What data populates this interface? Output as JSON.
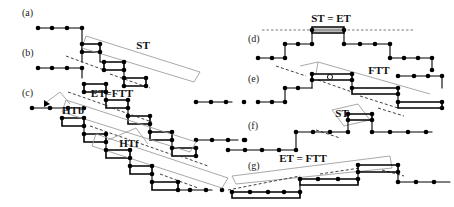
{
  "figure": {
    "width": 454,
    "height": 207,
    "background_color": "#ffffff",
    "node_color": "#000000",
    "edge_color": "#000000",
    "bracket_color": "#9a9a9a",
    "dashed_color": "#2a2a2a"
  },
  "panels": [
    {
      "id": "a",
      "label": "(a)",
      "x": 22,
      "y": 16,
      "operations": []
    },
    {
      "id": "b",
      "label": "(b)",
      "x": 22,
      "y": 56,
      "operations": [
        "ST"
      ]
    },
    {
      "id": "c",
      "label": "(c)",
      "x": 22,
      "y": 96,
      "operations": [
        "ET = FTT",
        "HTb",
        "HTf"
      ]
    },
    {
      "id": "d",
      "label": "(d)",
      "x": 248,
      "y": 42,
      "operations": [
        "ST = ET"
      ]
    },
    {
      "id": "e",
      "label": "(e)",
      "x": 248,
      "y": 82,
      "operations": [
        "FTT"
      ]
    },
    {
      "id": "f",
      "label": "(f)",
      "x": 248,
      "y": 129,
      "operations": [
        "ST"
      ]
    },
    {
      "id": "g",
      "label": "(g)",
      "x": 248,
      "y": 169,
      "operations": [
        "ET = FTT"
      ]
    }
  ],
  "operation_labels": [
    {
      "key": "st_b",
      "text": "ST",
      "x": 143,
      "y": 49,
      "panel": "b"
    },
    {
      "key": "et_ftt_c",
      "text": "ET=FTT",
      "x": 112,
      "y": 97,
      "panel": "c"
    },
    {
      "key": "htb_c",
      "text": "HTb",
      "x": 73,
      "y": 114,
      "panel": "c"
    },
    {
      "key": "htf_c",
      "text": "HTf",
      "x": 129,
      "y": 147,
      "panel": "c"
    },
    {
      "key": "st_et_d",
      "text": "ST = ET",
      "x": 331,
      "y": 22,
      "panel": "d"
    },
    {
      "key": "ftt_e",
      "text": "FTT",
      "x": 379,
      "y": 74,
      "panel": "e"
    },
    {
      "key": "st_f",
      "text": "ST",
      "x": 342,
      "y": 117,
      "panel": "f"
    },
    {
      "key": "et_ftt_g",
      "text": "ET = FTT",
      "x": 303,
      "y": 162,
      "panel": "g"
    }
  ],
  "legend_terms": {
    "ST": "Start Transformation",
    "ET": "End Transformation",
    "FTT": "Full Tail Transformation",
    "HTb": "Half Transformation backward",
    "HTf": "Half Transformation forward"
  }
}
